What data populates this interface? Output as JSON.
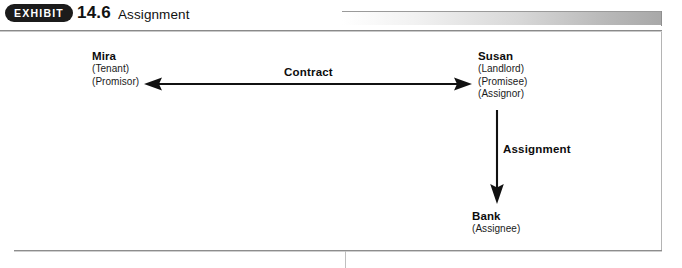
{
  "header": {
    "badge_label": "EXHIBIT",
    "exhibit_number": "14.6",
    "exhibit_title": "Assignment"
  },
  "diagram": {
    "nodes": [
      {
        "id": "mira",
        "name": "Mira",
        "roles": [
          "(Tenant)",
          "(Promisor)"
        ]
      },
      {
        "id": "susan",
        "name": "Susan",
        "roles": [
          "(Landlord)",
          "(Promisee)",
          "(Assignor)"
        ]
      },
      {
        "id": "bank",
        "name": "Bank",
        "roles": [
          "(Assignee)"
        ]
      }
    ],
    "edges": [
      {
        "id": "contract",
        "label": "Contract",
        "from": "mira",
        "to": "susan",
        "direction": "bidirectional",
        "orientation": "horizontal"
      },
      {
        "id": "assignment",
        "label": "Assignment",
        "from": "susan",
        "to": "bank",
        "direction": "unidirectional",
        "orientation": "vertical"
      }
    ]
  },
  "colors": {
    "badge_background": "#1b1b1b",
    "badge_text": "#ffffff",
    "ink": "#111111",
    "rule": "#8a8a8a",
    "gradient_start": "#ffffff",
    "gradient_end": "#a8a8a8"
  }
}
